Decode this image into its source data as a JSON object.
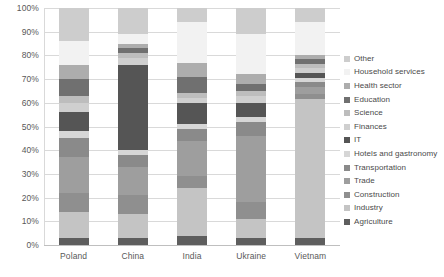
{
  "chart_data": {
    "type": "bar",
    "subtype": "100% stacked bar",
    "title": "",
    "xlabel": "",
    "ylabel": "",
    "ylim": [
      0,
      100
    ],
    "grid": true,
    "legend_position": "right",
    "categories": [
      "Poland",
      "China",
      "India",
      "Ukraine",
      "Vietnam"
    ],
    "ytick_labels": [
      "0%",
      "10%",
      "20%",
      "30%",
      "40%",
      "50%",
      "60%",
      "70%",
      "80%",
      "90%",
      "100%"
    ],
    "ytick_values": [
      0,
      10,
      20,
      30,
      40,
      50,
      60,
      70,
      80,
      90,
      100
    ],
    "series": [
      {
        "name": "Agriculture",
        "color": "#5e5e5e",
        "values": [
          3,
          3,
          4,
          3,
          3
        ]
      },
      {
        "name": "Industry",
        "color": "#c4c4c4",
        "values": [
          11,
          10,
          20,
          8,
          60
        ]
      },
      {
        "name": "Construction",
        "color": "#8f8f8f",
        "values": [
          8,
          8,
          5,
          7,
          2
        ]
      },
      {
        "name": "Trade",
        "color": "#9e9e9e",
        "values": [
          15,
          12,
          15,
          28,
          3
        ]
      },
      {
        "name": "Transportation",
        "color": "#8a8a8a",
        "values": [
          8,
          5,
          5,
          6,
          2
        ]
      },
      {
        "name": "Hotels and gastronomy",
        "color": "#d6d6d6",
        "values": [
          3,
          2,
          2,
          2,
          2
        ]
      },
      {
        "name": "IT",
        "color": "#555555",
        "values": [
          8,
          36,
          9,
          6,
          2
        ]
      },
      {
        "name": "Finances",
        "color": "#cfcfcf",
        "values": [
          4,
          3,
          2,
          3,
          2
        ]
      },
      {
        "name": "Science",
        "color": "#bdbdbd",
        "values": [
          3,
          2,
          2,
          2,
          2
        ]
      },
      {
        "name": "Education",
        "color": "#707070",
        "values": [
          7,
          2,
          7,
          3,
          2
        ]
      },
      {
        "name": "Health sector",
        "color": "#adadad",
        "values": [
          6,
          2,
          6,
          4,
          2
        ]
      },
      {
        "name": "Household services",
        "color": "#f2f2f2",
        "values": [
          10,
          4,
          17,
          17,
          14
        ]
      },
      {
        "name": "Other",
        "color": "#cdcdcd",
        "values": [
          14,
          11,
          6,
          11,
          6
        ]
      }
    ],
    "legend_order_top_to_bottom": [
      "Other",
      "Household services",
      "Health sector",
      "Education",
      "Science",
      "Finances",
      "IT",
      "Hotels and gastronomy",
      "Transportation",
      "Trade",
      "Construction",
      "Industry",
      "Agriculture"
    ]
  },
  "style": {
    "gridline_color": "#d9d9d9",
    "axis_color": "#bfbfbf",
    "tick_text_color": "#595959",
    "legend_text_color": "#4a4a4a",
    "background": "#ffffff"
  }
}
